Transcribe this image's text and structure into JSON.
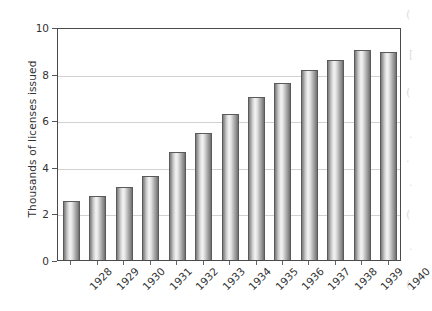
{
  "chart_data": {
    "type": "bar",
    "title": "",
    "subtitle": "",
    "xlabel": "",
    "ylabel": "Thousands of licenses issued",
    "categories": [
      "1928",
      "1929",
      "1930",
      "1931",
      "1932",
      "1933",
      "1934",
      "1935",
      "1936",
      "1937",
      "1938",
      "1939",
      "1940"
    ],
    "values": [
      2.55,
      2.75,
      3.15,
      3.6,
      4.65,
      5.45,
      6.25,
      7.0,
      7.6,
      8.15,
      8.6,
      9.0,
      8.95
    ],
    "ylim": [
      0,
      10
    ],
    "y_ticks": [
      0,
      2,
      4,
      6,
      8,
      10
    ],
    "y_tick_labels": [
      "0",
      "2",
      "4",
      "6",
      "8",
      "10"
    ],
    "grid": "horizontal",
    "legend": "none",
    "bar_style": "cylinder-gradient-grayscale",
    "x_tick_label_rotation": -45,
    "colors": {
      "bar_light": "#f4f4f4",
      "bar_mid": "#b4b4b4",
      "bar_dark": "#6f6f6f",
      "bar_outline": "#5a5a5a",
      "gridline": "#d2d2d2",
      "axis": "#4a4a4a",
      "text": "#333333",
      "background": "#ffffff"
    }
  },
  "artifacts": {
    "marks": [
      "(",
      "[",
      "(",
      ".",
      ".",
      ".",
      "(",
      ".",
      "("
    ]
  }
}
